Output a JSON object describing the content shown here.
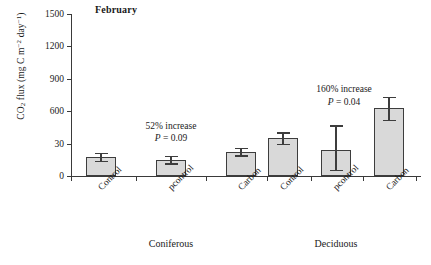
{
  "chart_data": {
    "type": "bar",
    "title": "February",
    "xlabel": "",
    "ylabel": "CO2 flux (mg C m-2 day-1)",
    "ylabel_parts": {
      "prefix": "CO",
      "sub1": "2",
      "mid": " flux (mg C m",
      "sup1": "−2",
      "mid2": " day",
      "sup2": "−1",
      "suffix": ")"
    },
    "ylim": [
      0,
      1500
    ],
    "yticks": [
      0,
      30,
      600,
      900,
      1200,
      1500
    ],
    "ytick_labels": [
      "0",
      "30",
      "600",
      "900",
      "1200",
      "1500"
    ],
    "grid": false,
    "legend": "none",
    "groups": [
      {
        "name": "Coniferous",
        "categories": [
          "Control",
          "pcontrol",
          "Carbon"
        ],
        "values": [
          175,
          150,
          225
        ],
        "errors_upper": [
          215,
          185,
          262
        ],
        "errors_lower": [
          140,
          118,
          190
        ],
        "annotation_increase": "52% increase",
        "annotation_p": "P = 0.09"
      },
      {
        "name": "Deciduous",
        "categories": [
          "Control",
          "pcontrol",
          "Carbon"
        ],
        "values": [
          350,
          240,
          630
        ],
        "errors_upper": [
          405,
          470,
          735
        ],
        "errors_lower": [
          300,
          60,
          520
        ],
        "annotation_increase": "160% increase",
        "annotation_p": "P = 0.04"
      }
    ],
    "colors": {
      "bar_fill": "#d9d9d9",
      "bar_stroke": "#3d3d3d",
      "axis": "#3a3a3a",
      "text": "#1a1a1a"
    }
  }
}
